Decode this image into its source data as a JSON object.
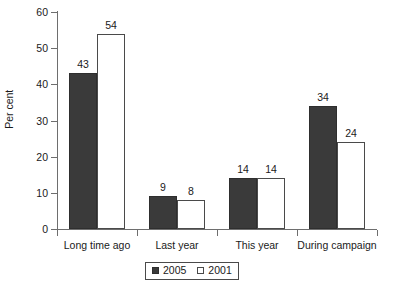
{
  "chart_data": {
    "type": "bar",
    "title": "",
    "xlabel": "",
    "ylabel": "Per cent",
    "ylim": [
      0,
      60
    ],
    "yticks": [
      0,
      10,
      20,
      30,
      40,
      50,
      60
    ],
    "ytick_labels": [
      "0",
      "10",
      "20",
      "30",
      "40",
      "50",
      "60"
    ],
    "grid": false,
    "legend_position": "bottom-center",
    "categories": [
      "Long time ago",
      "Last year",
      "This year",
      "During campaign"
    ],
    "series": [
      {
        "name": "2005",
        "color": "#3a3a3a",
        "values": [
          43,
          9,
          14,
          34
        ],
        "value_labels": [
          "43",
          "9",
          "14",
          "34"
        ]
      },
      {
        "name": "2001",
        "color": "#ffffff",
        "values": [
          54,
          8,
          14,
          24
        ],
        "value_labels": [
          "54",
          "8",
          "14",
          "24"
        ]
      }
    ]
  },
  "legend": {
    "entries": [
      {
        "label": "2005"
      },
      {
        "label": "2001"
      }
    ]
  }
}
